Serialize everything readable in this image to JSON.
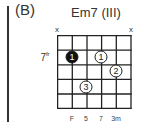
{
  "section_label": "(B)",
  "chord": {
    "name": "Em7 (III)",
    "fret_label": "7",
    "fret_label_suffix": "fr",
    "muted_strings": [
      {
        "string": 1,
        "symbol": "x"
      },
      {
        "string": 6,
        "symbol": "x"
      }
    ],
    "fingers": [
      {
        "string": 2,
        "fret": 1,
        "finger": "1",
        "filled": true
      },
      {
        "string": 4,
        "fret": 1,
        "finger": "1",
        "filled": false
      },
      {
        "string": 5,
        "fret": 2,
        "finger": "2",
        "filled": false
      },
      {
        "string": 3,
        "fret": 3,
        "finger": "3",
        "filled": false
      }
    ],
    "bottom_labels": [
      {
        "string": 2,
        "text": "F"
      },
      {
        "string": 3,
        "text": "5"
      },
      {
        "string": 4,
        "text": "7"
      },
      {
        "string": 5,
        "text": "3m"
      }
    ],
    "num_strings": 6,
    "num_frets": 5
  }
}
